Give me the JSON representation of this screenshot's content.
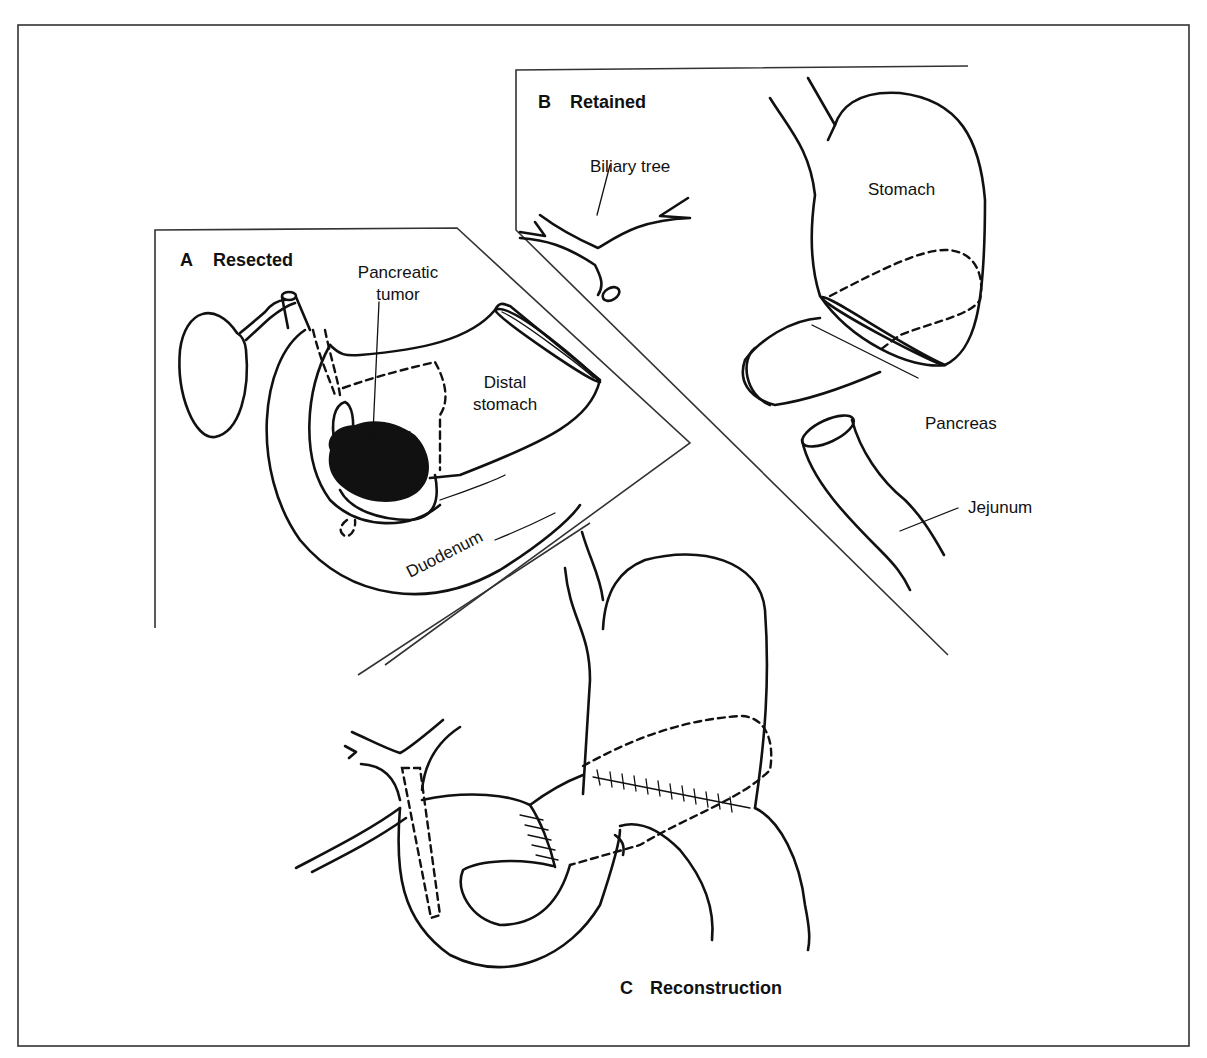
{
  "figure": {
    "panels": [
      {
        "id": "A",
        "letter": "A",
        "title": "Resected"
      },
      {
        "id": "B",
        "letter": "B",
        "title": "Retained"
      },
      {
        "id": "C",
        "letter": "C",
        "title": "Reconstruction"
      }
    ],
    "labels": {
      "pancreatic_tumor_line1": "Pancreatic",
      "pancreatic_tumor_line2": "tumor",
      "distal_stomach_line1": "Distal",
      "distal_stomach_line2": "stomach",
      "duodenum": "Duodenum",
      "biliary_tree": "Biliary tree",
      "stomach": "Stomach",
      "pancreas": "Pancreas",
      "jejunum": "Jejunum"
    },
    "colors": {
      "ink": "#111111",
      "background": "#ffffff",
      "frame": "#333333"
    }
  }
}
